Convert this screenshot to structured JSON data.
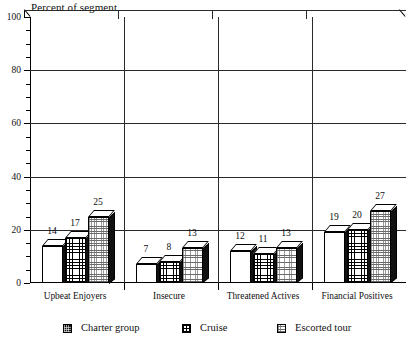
{
  "chart_data": {
    "type": "bar",
    "title": "Percent of segment",
    "xlabel": "",
    "ylabel": "",
    "ylim": [
      0,
      100
    ],
    "ytick_labels": [
      "0",
      "20",
      "40",
      "60",
      "80",
      "100"
    ],
    "ytick_values": [
      0,
      20,
      40,
      60,
      80,
      100
    ],
    "minor_tick_step": 5,
    "grid": "horizontal-and-vertical",
    "legend_position": "bottom",
    "categories": [
      "Upbeat Enjoyers",
      "Insecure",
      "Threatened Actives",
      "Financial Positives"
    ],
    "series": [
      {
        "name": "Charter group",
        "values": [
          14,
          7,
          12,
          19
        ],
        "pattern": "dark-crosshatch"
      },
      {
        "name": "Cruise",
        "values": [
          17,
          8,
          11,
          20
        ],
        "pattern": "grid"
      },
      {
        "name": "Escorted tour",
        "values": [
          25,
          13,
          13,
          27
        ],
        "pattern": "fine-dotted"
      }
    ]
  },
  "legend": {
    "items": [
      {
        "label": "Charter group"
      },
      {
        "label": "Cruise"
      },
      {
        "label": "Escorted tour"
      }
    ]
  },
  "colors": {
    "axis": "#000000",
    "grid": "#2a2a2a",
    "background": "#ffffff",
    "charter": "#141414",
    "cruise": "#ffffff",
    "escorted": "#ffffff"
  }
}
